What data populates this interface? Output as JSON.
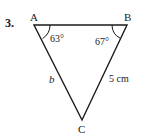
{
  "problem": {
    "number": "3."
  },
  "triangle": {
    "vertices": {
      "A": "A",
      "B": "B",
      "C": "C"
    },
    "angles": {
      "A": "63°",
      "B": "67°"
    },
    "sides": {
      "AC": "b",
      "BC": "5 cm"
    },
    "colors": {
      "stroke": "#1a1a1a",
      "background": "#ffffff"
    }
  }
}
